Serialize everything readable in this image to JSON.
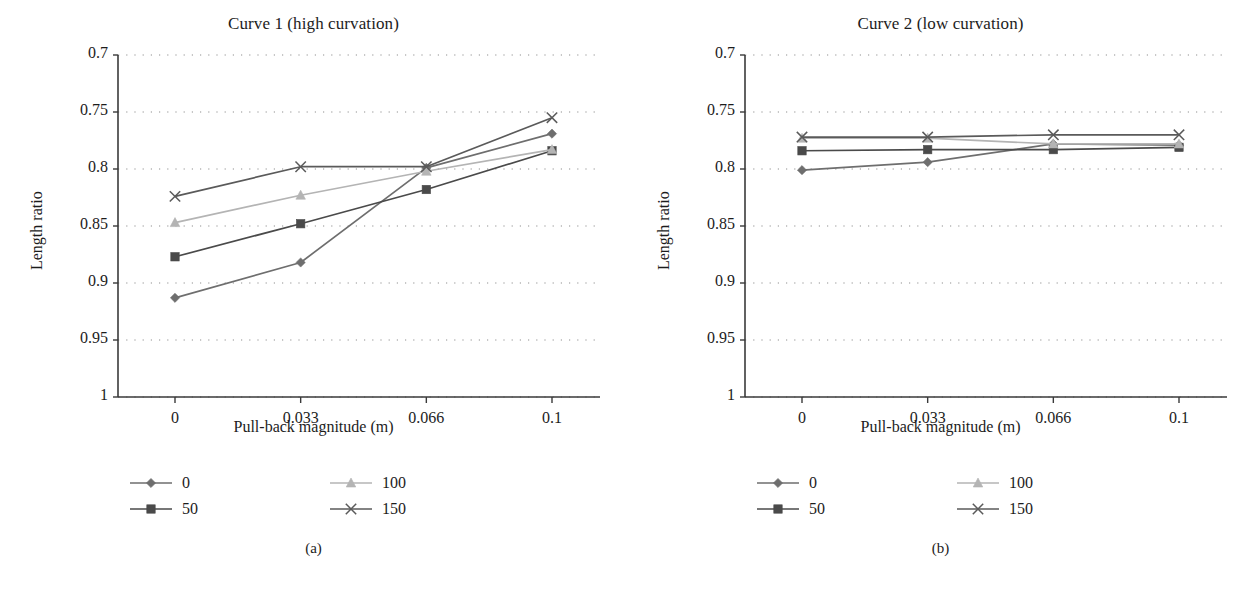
{
  "figure": {
    "panels": [
      {
        "caption": "(a)",
        "title": "Curve 1 (high curvation)",
        "xlabel": "Pull-back magnitude (m)",
        "ylabel": "Length ratio"
      },
      {
        "caption": "(b)",
        "title": "Curve 2 (low curvation)",
        "xlabel": "Pull-back magnitude (m)",
        "ylabel": "Length ratio"
      }
    ],
    "legend": {
      "items": [
        {
          "label": "0",
          "marker": "diamond-marker",
          "color": "#6e6e6e"
        },
        {
          "label": "100",
          "marker": "triangle-marker",
          "color": "#b4b4b4"
        },
        {
          "label": "50",
          "marker": "square-marker",
          "color": "#4a4a4a"
        },
        {
          "label": "150",
          "marker": "x-marker",
          "color": "#5a5a5a"
        }
      ]
    },
    "axis": {
      "yticks": [
        "1",
        "0.95",
        "0.9",
        "0.85",
        "0.8",
        "0.75",
        "0.7"
      ],
      "xticks": [
        "0",
        "0.033",
        "0.066",
        "0.1"
      ]
    }
  },
  "chart_data": [
    {
      "type": "line",
      "title": "Curve 1 (high curvation)",
      "caption": "(a)",
      "xlabel": "Pull-back magnitude (m)",
      "ylabel": "Length ratio",
      "categories": [
        "0",
        "0.033",
        "0.066",
        "0.1"
      ],
      "x": [
        0,
        0.033,
        0.066,
        0.1
      ],
      "ylim": [
        0.7,
        1
      ],
      "yticks": [
        0.7,
        0.75,
        0.8,
        0.85,
        0.9,
        0.95,
        1
      ],
      "grid": "horizontal-dotted",
      "legend_position": "below-plot",
      "series": [
        {
          "name": "0",
          "marker": "diamond",
          "color": "#6e6e6e",
          "values": [
            0.787,
            0.818,
            0.901,
            0.931
          ]
        },
        {
          "name": "50",
          "marker": "square",
          "color": "#4a4a4a",
          "values": [
            0.823,
            0.852,
            0.882,
            0.916
          ]
        },
        {
          "name": "100",
          "marker": "triangle",
          "color": "#b4b4b4",
          "values": [
            0.853,
            0.877,
            0.898,
            0.917
          ]
        },
        {
          "name": "150",
          "marker": "x",
          "color": "#5a5a5a",
          "values": [
            0.876,
            0.902,
            0.902,
            0.945
          ]
        }
      ]
    },
    {
      "type": "line",
      "title": "Curve 2 (low curvation)",
      "caption": "(b)",
      "xlabel": "Pull-back magnitude (m)",
      "ylabel": "Length ratio",
      "categories": [
        "0",
        "0.033",
        "0.066",
        "0.1"
      ],
      "x": [
        0,
        0.033,
        0.066,
        0.1
      ],
      "ylim": [
        0.7,
        1
      ],
      "yticks": [
        0.7,
        0.75,
        0.8,
        0.85,
        0.9,
        0.95,
        1
      ],
      "grid": "horizontal-dotted",
      "legend_position": "below-plot",
      "series": [
        {
          "name": "0",
          "marker": "diamond",
          "color": "#6e6e6e",
          "values": [
            0.899,
            0.906,
            0.922,
            0.921
          ]
        },
        {
          "name": "50",
          "marker": "square",
          "color": "#4a4a4a",
          "values": [
            0.916,
            0.917,
            0.917,
            0.919
          ]
        },
        {
          "name": "100",
          "marker": "triangle",
          "color": "#b4b4b4",
          "values": [
            0.927,
            0.927,
            0.922,
            0.922
          ]
        },
        {
          "name": "150",
          "marker": "x",
          "color": "#5a5a5a",
          "values": [
            0.928,
            0.928,
            0.93,
            0.93
          ]
        }
      ]
    }
  ]
}
